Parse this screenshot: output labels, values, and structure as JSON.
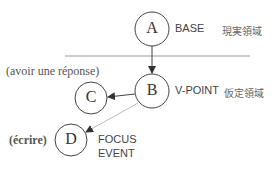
{
  "nodes": {
    "a": {
      "letter": "A",
      "label": "BASE",
      "sublabel": "現実領域"
    },
    "b": {
      "letter": "B",
      "label": "V-POINT",
      "sublabel": "仮定領域"
    },
    "c": {
      "letter": "C",
      "annotation": "(avoir une réponse)"
    },
    "d": {
      "letter": "D",
      "annotation": "(écrire)",
      "label_line1": "FOCUS",
      "label_line2": "EVENT"
    }
  },
  "colors": {
    "stroke": "#444444",
    "divider": "#999999",
    "faint_arrow": "#bbbbbb"
  }
}
